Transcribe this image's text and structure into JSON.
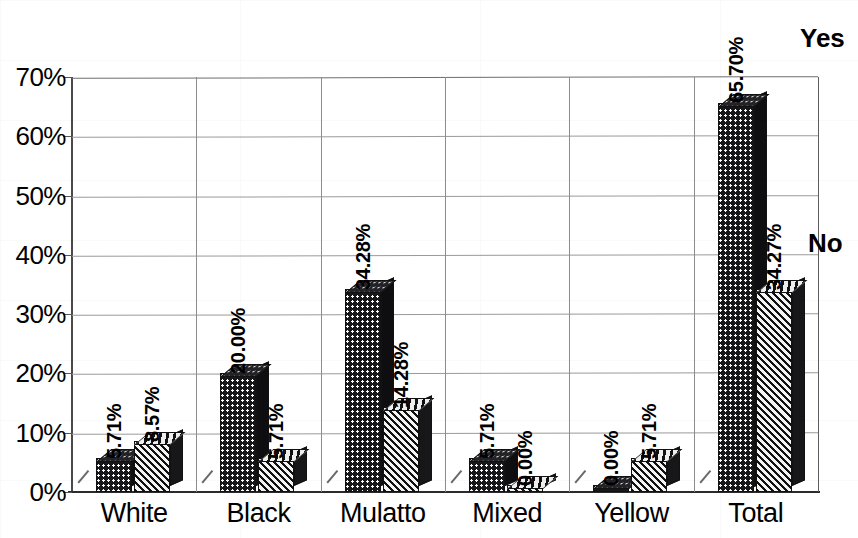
{
  "chart_data": {
    "type": "bar",
    "title": "",
    "xlabel": "",
    "ylabel": "",
    "ylim": [
      0,
      70
    ],
    "ytick_labels": [
      "0%",
      "10%",
      "20%",
      "30%",
      "40%",
      "50%",
      "60%",
      "70%"
    ],
    "ytick_values": [
      0,
      10,
      20,
      30,
      40,
      50,
      60,
      70
    ],
    "grid": true,
    "legend_position": "right",
    "categories": [
      "White",
      "Black",
      "Mulatto",
      "Mixed",
      "Yellow",
      "Total"
    ],
    "series": [
      {
        "name": "Yes",
        "pattern": "dotted",
        "values": [
          5.71,
          20.0,
          34.28,
          5.71,
          0.0,
          65.7
        ],
        "labels": [
          "5.71%",
          "20.00%",
          "34.28%",
          "5.71%",
          "0.00%",
          "65.70%"
        ]
      },
      {
        "name": "No",
        "pattern": "diagonal-hatch",
        "values": [
          8.57,
          5.71,
          14.28,
          0.0,
          5.71,
          34.27
        ],
        "labels": [
          "8.57%",
          "5.71%",
          "14.28%",
          "0.00%",
          "5.71%",
          "34.27%"
        ]
      }
    ]
  },
  "legend": {
    "yes": "Yes",
    "no": "No"
  },
  "colors": {
    "series_yes": "#17171a",
    "series_no": "#f2f2f2",
    "hatch": "#111111",
    "grid": "#9a9a9a",
    "axis": "#2b2b2b"
  }
}
